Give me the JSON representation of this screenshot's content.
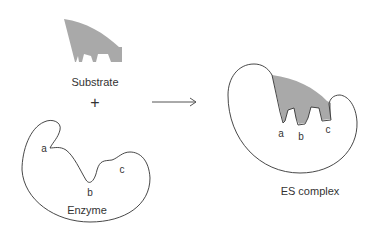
{
  "substrate": {
    "label": "Substrate",
    "fill": "#a9a9a9"
  },
  "operator": {
    "plus": "+"
  },
  "enzyme": {
    "label": "Enzyme",
    "sites": {
      "a": "a",
      "b": "b",
      "c": "c"
    }
  },
  "es_complex": {
    "label": "ES complex",
    "sites": {
      "a": "a",
      "b": "b",
      "c": "c"
    }
  },
  "colors": {
    "outline": "#333333",
    "substrate": "#a9a9a9"
  }
}
